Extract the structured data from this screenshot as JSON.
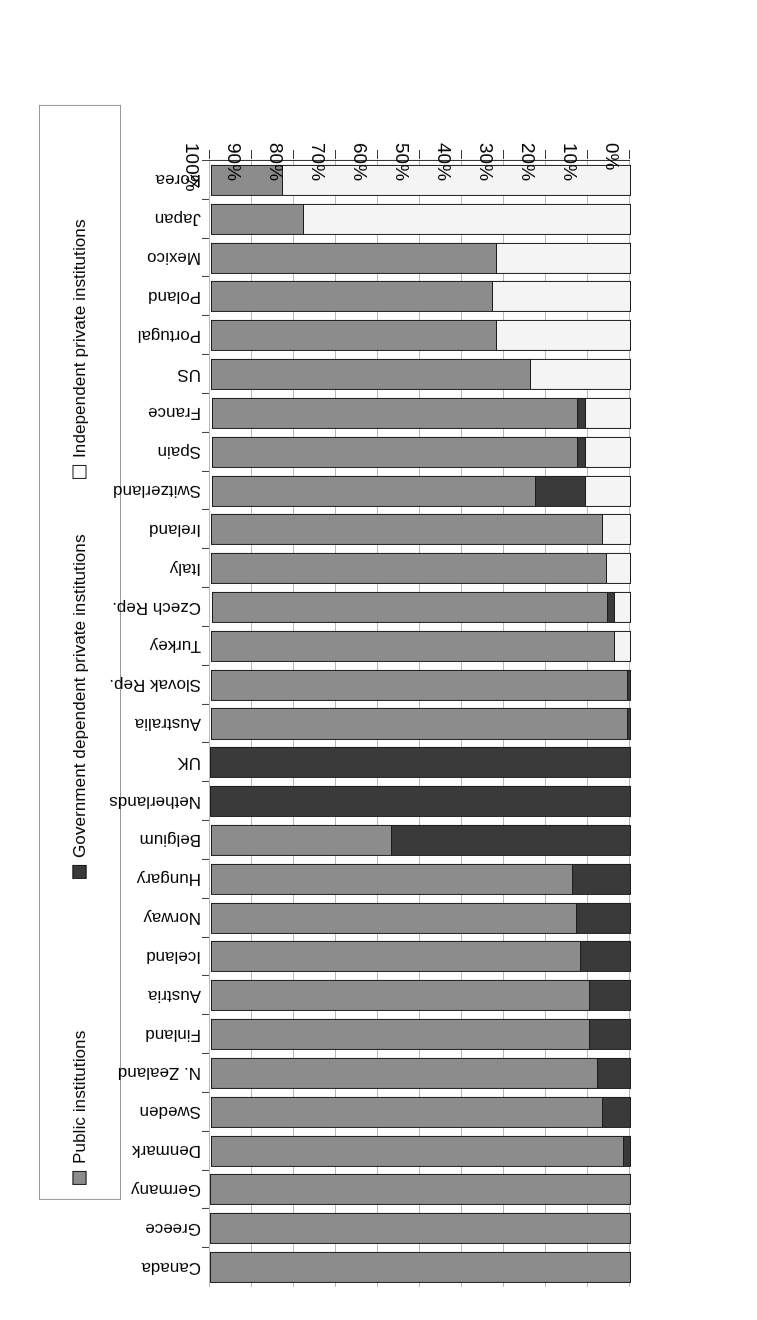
{
  "figure": {
    "rotation_deg": 180,
    "orientation_note": "scanned upside down"
  },
  "legend": {
    "position": "left",
    "entries": [
      {
        "label": "Public institutions",
        "icon": "square-marker-gray",
        "color": "#8c8c8c"
      },
      {
        "label": "Government dependent private institutions",
        "icon": "square-marker-dark",
        "color": "#3a3a3a"
      },
      {
        "label": "Independent private institutions",
        "icon": "square-marker-white",
        "color": "#fcfcfc"
      }
    ]
  },
  "axis": {
    "value_ticks": [
      "0%",
      "10%",
      "20%",
      "30%",
      "40%",
      "50%",
      "60%",
      "70%",
      "80%",
      "90%",
      "100%"
    ],
    "value_min": 0,
    "value_max": 100
  },
  "chart_data": {
    "type": "bar",
    "subtype": "stacked-horizontal-100pct",
    "title": "",
    "xlabel": "",
    "ylabel": "",
    "xlim": [
      0,
      100
    ],
    "grid": true,
    "legend_position": "left",
    "categories": [
      "Canada",
      "Greece",
      "Germany",
      "Denmark",
      "Sweden",
      "N. Zealand",
      "Finland",
      "Austria",
      "Iceland",
      "Norway",
      "Hungary",
      "Belgium",
      "Netherlands",
      "UK",
      "Australia",
      "Slovak Rep.",
      "Turkey",
      "Czech Rep.",
      "Italy",
      "Ireland",
      "Switzerland",
      "Spain",
      "France",
      "US",
      "Portugal",
      "Poland",
      "Mexico",
      "Japan",
      "Korea"
    ],
    "series": [
      {
        "name": "Public institutions",
        "color": "#8c8c8c",
        "values": [
          100,
          100,
          100,
          98,
          93,
          92,
          90,
          90,
          88,
          87,
          86,
          43,
          0,
          0,
          99,
          99,
          96,
          94,
          94,
          93,
          77,
          87,
          87,
          76,
          68,
          67,
          68,
          22,
          17
        ]
      },
      {
        "name": "Government dependent private institutions",
        "color": "#3a3a3a",
        "values": [
          0,
          0,
          0,
          2,
          7,
          8,
          10,
          10,
          12,
          13,
          14,
          57,
          100,
          100,
          1,
          1,
          0,
          2,
          0,
          0,
          12,
          2,
          2,
          0,
          0,
          0,
          0,
          0,
          0
        ]
      },
      {
        "name": "Independent private institutions",
        "color": "#f4f4f4",
        "values": [
          0,
          0,
          0,
          0,
          0,
          0,
          0,
          0,
          0,
          0,
          0,
          0,
          0,
          0,
          0,
          0,
          4,
          4,
          6,
          7,
          11,
          11,
          11,
          24,
          32,
          33,
          32,
          78,
          83
        ]
      }
    ]
  }
}
